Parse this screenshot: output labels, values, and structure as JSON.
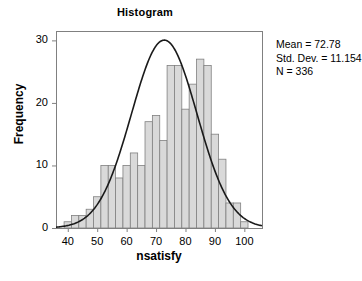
{
  "chart_data": {
    "type": "bar",
    "title": "Histogram",
    "xlabel": "nsatisfy",
    "ylabel": "Frequency",
    "xlim": [
      36,
      106
    ],
    "ylim": [
      0,
      31.5
    ],
    "xticks": [
      40,
      50,
      60,
      70,
      80,
      90,
      100
    ],
    "yticks": [
      0,
      10,
      20,
      30
    ],
    "grid": false,
    "legend": null,
    "bar_width": 2.5,
    "categories": [
      40.0,
      42.5,
      45.0,
      47.5,
      50.0,
      52.5,
      55.0,
      57.5,
      60.0,
      62.5,
      65.0,
      67.5,
      70.0,
      72.5,
      75.0,
      77.5,
      80.0,
      82.5,
      85.0,
      87.5,
      90.0,
      92.5,
      95.0,
      97.5,
      100.0
    ],
    "values": [
      1,
      2,
      2,
      3,
      5,
      10,
      10,
      8,
      10,
      12,
      10,
      17,
      18,
      14,
      26,
      26,
      19,
      23,
      27,
      26,
      15,
      11,
      4,
      4,
      1
    ],
    "overlay_curve": {
      "name": "normal",
      "mean": 72.78,
      "std_dev": 11.154,
      "n": 336,
      "bin_width": 2.5,
      "peak_value": 24,
      "color": "#1a1a1a"
    },
    "annotations": {
      "mean_label": "Mean = 72.78",
      "sd_label": "Std. Dev. = 11.154",
      "n_label": "N = 336"
    },
    "colors": {
      "bar_fill": "#d9d9d9",
      "bar_border": "#808080",
      "axis": "#808080",
      "text": "#000000",
      "curve": "#1a1a1a"
    }
  }
}
